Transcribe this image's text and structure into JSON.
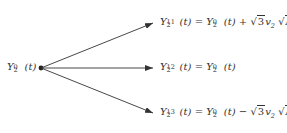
{
  "diagram": {
    "type": "branching-tree",
    "root": {
      "label": "Y₂⁰(t)",
      "base": "Y",
      "sub": "2",
      "sup": "0",
      "arg": "(t)"
    },
    "branches": [
      {
        "label": "Y₂¹¹(t) = Y₂⁰(t) + √3 v₂ √Δt",
        "lhs": {
          "base": "Y",
          "sub": "2",
          "sup": "11",
          "arg": "(t)"
        },
        "eq": "=",
        "rhs_term": {
          "base": "Y",
          "sub": "2",
          "sup": "0",
          "arg": "(t)"
        },
        "op": "+",
        "sqrt3": "3",
        "v": "v",
        "v_sub": "2",
        "dt": "Δt"
      },
      {
        "label": "Y₂¹²(t) = Y₂⁰(t)",
        "lhs": {
          "base": "Y",
          "sub": "2",
          "sup": "12",
          "arg": "(t)"
        },
        "eq": "=",
        "rhs_term": {
          "base": "Y",
          "sub": "2",
          "sup": "0",
          "arg": "(t)"
        }
      },
      {
        "label": "Y₂¹³(t) = Y₂⁰(t) − √3 v₂ √Δt",
        "lhs": {
          "base": "Y",
          "sub": "2",
          "sup": "13",
          "arg": "(t)"
        },
        "eq": "=",
        "rhs_term": {
          "base": "Y",
          "sub": "2",
          "sup": "0",
          "arg": "(t)"
        },
        "op": "−",
        "sqrt3": "3",
        "v": "v",
        "v_sub": "2",
        "dt": "Δt"
      }
    ],
    "colors": {
      "line": "#333333",
      "text": "#333333",
      "background": "#ffffff"
    }
  }
}
